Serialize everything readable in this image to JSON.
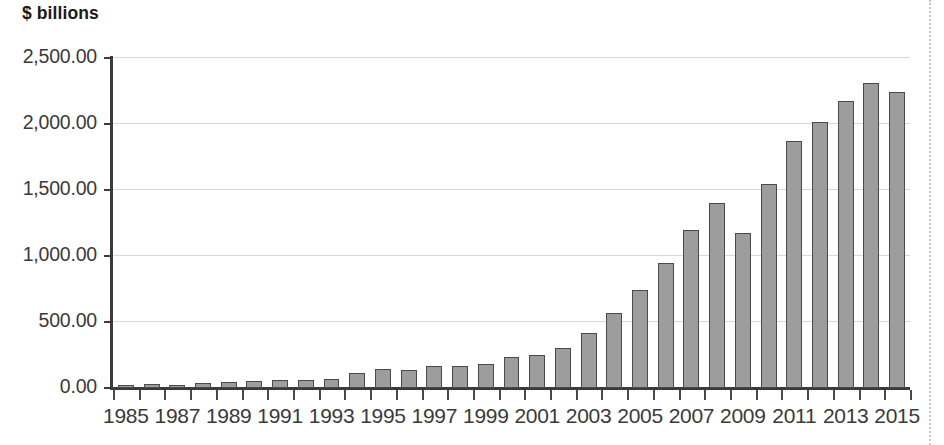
{
  "chart_data": {
    "type": "bar",
    "title": "",
    "subtitle": "",
    "ylabel": "$ billions",
    "xlabel": "",
    "ylim": [
      0,
      2500
    ],
    "ytick_labels": [
      "0.00",
      "500.00",
      "1,000.00",
      "1,500.00",
      "2,000.00",
      "2,500.00"
    ],
    "ytick_values": [
      0,
      500,
      1000,
      1500,
      2000,
      2500
    ],
    "grid": true,
    "legend": "none",
    "bar_color": "#9d9d9d",
    "bar_edge_color": "#4a4a4a",
    "categories": [
      "1985",
      "1986",
      "1987",
      "1988",
      "1989",
      "1990",
      "1991",
      "1992",
      "1993",
      "1994",
      "1995",
      "1996",
      "1997",
      "1998",
      "1999",
      "2000",
      "2001",
      "2002",
      "2003",
      "2004",
      "2005",
      "2006",
      "2007",
      "2008",
      "2009",
      "2010",
      "2011",
      "2012",
      "2013",
      "2014",
      "2015"
    ],
    "values": [
      20,
      28,
      25,
      35,
      42,
      50,
      58,
      62,
      68,
      110,
      145,
      140,
      165,
      165,
      180,
      235,
      250,
      305,
      420,
      565,
      740,
      945,
      1200,
      1405,
      1175,
      1545,
      1870,
      2015,
      2175,
      2310,
      2245
    ],
    "xtick_labels": [
      "1985",
      "1987",
      "1989",
      "1991",
      "1993",
      "1995",
      "1997",
      "1999",
      "2001",
      "2003",
      "2005",
      "2007",
      "2009",
      "2011",
      "2013",
      "2015"
    ],
    "xtick_label_step": 2
  }
}
